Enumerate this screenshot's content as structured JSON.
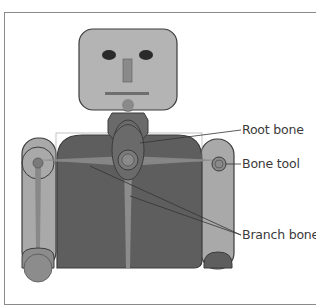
{
  "figure": {
    "callouts": [
      {
        "id": "root",
        "label": "Root bone"
      },
      {
        "id": "tool",
        "label": "Bone tool"
      },
      {
        "id": "branch",
        "label": "Branch bones"
      }
    ]
  },
  "colors": {
    "head": "#b4b4b4",
    "torso": "#5e5e5e",
    "arm": "#a8a8a8",
    "bone": "#8c8c8c",
    "outline": "#3c3c3c",
    "frame": "#8a8a8a"
  }
}
